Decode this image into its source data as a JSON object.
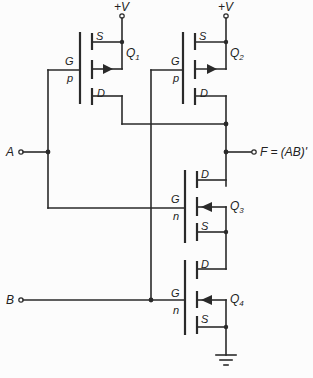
{
  "diagram": {
    "supply_label": "+V",
    "output_label": "F = (AB)'",
    "inputs": [
      {
        "name": "A"
      },
      {
        "name": "B"
      }
    ],
    "transistors": [
      {
        "id": "Q",
        "sub": "1",
        "type": "p",
        "gate": "G",
        "source": "S",
        "drain": "D"
      },
      {
        "id": "Q",
        "sub": "2",
        "type": "p",
        "gate": "G",
        "source": "S",
        "drain": "D"
      },
      {
        "id": "Q",
        "sub": "3",
        "type": "n",
        "gate": "G",
        "source": "S",
        "drain": "D"
      },
      {
        "id": "Q",
        "sub": "4",
        "type": "n",
        "gate": "G",
        "source": "S",
        "drain": "D"
      }
    ],
    "ground_symbol": "ground-icon"
  }
}
